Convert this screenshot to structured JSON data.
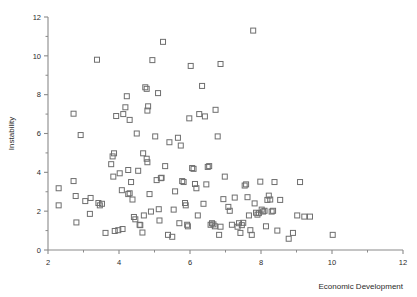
{
  "chart_data": {
    "type": "scatter",
    "title": "",
    "xlabel": "Economic Development",
    "ylabel": "Instability",
    "xlim": [
      2,
      12
    ],
    "ylim": [
      0,
      12
    ],
    "xticks": [
      2,
      4,
      6,
      8,
      10,
      12
    ],
    "xtick_labels": [
      "2",
      "4",
      "6",
      "8",
      "10",
      "12"
    ],
    "xminor_ticks": [
      3,
      5,
      7,
      9,
      11
    ],
    "yticks": [
      0,
      2,
      4,
      6,
      8,
      10,
      12
    ],
    "ytick_labels": [
      "0",
      "2",
      "4",
      "6",
      "8",
      "10",
      "12"
    ],
    "yminor_ticks": [
      1,
      3,
      5,
      7,
      9,
      11
    ],
    "grid": false,
    "legend": null,
    "marker": "open-square",
    "marker_size": 5,
    "marker_color": "#6e6e6e",
    "axis_color": "#8a8a8a",
    "points": [
      [
        2.3,
        3.18
      ],
      [
        2.3,
        2.3
      ],
      [
        2.72,
        3.55
      ],
      [
        2.72,
        7.02
      ],
      [
        2.78,
        2.78
      ],
      [
        2.8,
        1.42
      ],
      [
        2.92,
        5.92
      ],
      [
        3.05,
        2.52
      ],
      [
        3.2,
        2.68
      ],
      [
        3.18,
        1.86
      ],
      [
        3.38,
        9.8
      ],
      [
        3.42,
        2.42
      ],
      [
        3.46,
        2.3
      ],
      [
        3.52,
        2.38
      ],
      [
        3.62,
        0.88
      ],
      [
        3.78,
        4.42
      ],
      [
        3.82,
        4.82
      ],
      [
        3.86,
        4.98
      ],
      [
        3.84,
        3.78
      ],
      [
        3.88,
        0.98
      ],
      [
        3.92,
        6.9
      ],
      [
        3.98,
        1.02
      ],
      [
        4.02,
        3.95
      ],
      [
        4.08,
        3.08
      ],
      [
        4.1,
        1.08
      ],
      [
        4.12,
        7.0
      ],
      [
        4.18,
        7.35
      ],
      [
        4.26,
        4.12
      ],
      [
        4.3,
        2.92
      ],
      [
        4.26,
        2.88
      ],
      [
        4.22,
        7.92
      ],
      [
        4.3,
        6.7
      ],
      [
        4.34,
        3.5
      ],
      [
        4.38,
        2.6
      ],
      [
        4.42,
        1.7
      ],
      [
        4.46,
        1.58
      ],
      [
        4.5,
        6.0
      ],
      [
        4.54,
        4.08
      ],
      [
        4.58,
        1.3
      ],
      [
        4.6,
        1.28
      ],
      [
        4.66,
        0.9
      ],
      [
        4.7,
        1.78
      ],
      [
        4.68,
        4.98
      ],
      [
        4.74,
        8.38
      ],
      [
        4.78,
        8.3
      ],
      [
        4.78,
        4.7
      ],
      [
        4.8,
        4.52
      ],
      [
        4.82,
        7.4
      ],
      [
        4.8,
        7.18
      ],
      [
        4.86,
        2.88
      ],
      [
        4.9,
        1.98
      ],
      [
        4.94,
        9.78
      ],
      [
        5.02,
        5.85
      ],
      [
        5.06,
        3.6
      ],
      [
        5.1,
        8.08
      ],
      [
        5.12,
        2.1
      ],
      [
        5.14,
        1.52
      ],
      [
        5.18,
        3.7
      ],
      [
        5.2,
        3.72
      ],
      [
        5.24,
        10.72
      ],
      [
        5.3,
        4.32
      ],
      [
        5.38,
        0.78
      ],
      [
        5.42,
        5.55
      ],
      [
        5.5,
        0.68
      ],
      [
        5.54,
        2.08
      ],
      [
        5.58,
        3.02
      ],
      [
        5.66,
        5.78
      ],
      [
        5.7,
        1.38
      ],
      [
        5.74,
        5.38
      ],
      [
        5.78,
        3.55
      ],
      [
        5.82,
        3.5
      ],
      [
        5.86,
        2.42
      ],
      [
        5.88,
        2.3
      ],
      [
        5.92,
        1.3
      ],
      [
        5.94,
        1.22
      ],
      [
        5.98,
        6.78
      ],
      [
        6.02,
        9.48
      ],
      [
        6.06,
        4.22
      ],
      [
        6.1,
        4.18
      ],
      [
        6.14,
        3.4
      ],
      [
        6.18,
        3.18
      ],
      [
        6.22,
        1.78
      ],
      [
        6.26,
        7.0
      ],
      [
        6.34,
        8.45
      ],
      [
        6.38,
        2.38
      ],
      [
        6.42,
        6.88
      ],
      [
        6.46,
        3.38
      ],
      [
        6.5,
        4.28
      ],
      [
        6.54,
        4.32
      ],
      [
        6.58,
        1.3
      ],
      [
        6.62,
        1.38
      ],
      [
        6.66,
        1.32
      ],
      [
        6.7,
        1.22
      ],
      [
        6.72,
        7.22
      ],
      [
        6.78,
        5.85
      ],
      [
        6.82,
        0.78
      ],
      [
        6.86,
        1.2
      ],
      [
        6.94,
        2.62
      ],
      [
        6.98,
        3.78
      ],
      [
        7.08,
        2.22
      ],
      [
        7.12,
        2.02
      ],
      [
        7.18,
        1.3
      ],
      [
        7.26,
        2.7
      ],
      [
        7.34,
        1.2
      ],
      [
        7.38,
        1.38
      ],
      [
        7.42,
        0.88
      ],
      [
        7.46,
        1.28
      ],
      [
        7.5,
        1.4
      ],
      [
        7.54,
        3.32
      ],
      [
        7.58,
        3.38
      ],
      [
        7.62,
        2.72
      ],
      [
        7.66,
        1.78
      ],
      [
        7.7,
        1.02
      ],
      [
        7.74,
        0.78
      ],
      [
        7.78,
        11.3
      ],
      [
        7.82,
        2.4
      ],
      [
        7.86,
        1.92
      ],
      [
        7.9,
        1.82
      ],
      [
        7.94,
        1.9
      ],
      [
        7.98,
        3.52
      ],
      [
        8.02,
        2.08
      ],
      [
        8.06,
        1.98
      ],
      [
        8.1,
        2.02
      ],
      [
        8.14,
        1.22
      ],
      [
        8.18,
        2.58
      ],
      [
        8.22,
        2.8
      ],
      [
        8.26,
        2.6
      ],
      [
        8.3,
        1.98
      ],
      [
        8.34,
        2.02
      ],
      [
        8.38,
        3.5
      ],
      [
        8.46,
        1.0
      ],
      [
        8.54,
        2.58
      ],
      [
        8.78,
        0.58
      ],
      [
        8.9,
        0.88
      ],
      [
        9.02,
        1.78
      ],
      [
        9.1,
        3.5
      ],
      [
        9.22,
        1.72
      ],
      [
        9.38,
        1.72
      ],
      [
        10.02,
        0.78
      ],
      [
        6.86,
        9.58
      ]
    ]
  }
}
